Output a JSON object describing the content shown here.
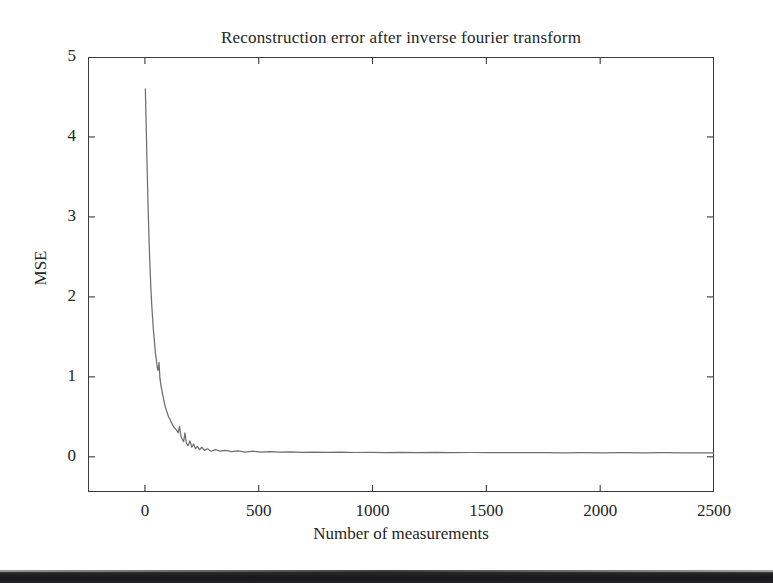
{
  "figure": {
    "background_color": "#ffffff",
    "foreground_color": "#242424",
    "line_color": "#6e6e6e"
  },
  "chart_data": {
    "type": "line",
    "title": "Reconstruction error after inverse fourier transform",
    "xlabel": "Number of measurements",
    "ylabel": "MSE",
    "xlim": [
      -250,
      2500
    ],
    "ylim": [
      -0.44,
      5
    ],
    "grid": false,
    "legend": null,
    "xticks": [
      0,
      500,
      1000,
      1500,
      2000,
      2500
    ],
    "xticklabels": [
      "0",
      "500",
      "1000",
      "1500",
      "2000",
      "2500"
    ],
    "yticks": [
      0,
      1,
      2,
      3,
      4,
      5
    ],
    "yticklabels": [
      "0",
      "1",
      "2",
      "3",
      "4",
      "5"
    ],
    "series": [
      {
        "name": "MSE",
        "color": "#6e6e6e",
        "x": [
          2,
          6,
          10,
          14,
          18,
          22,
          26,
          30,
          34,
          38,
          42,
          46,
          50,
          54,
          58,
          62,
          66,
          70,
          74,
          78,
          82,
          86,
          90,
          94,
          98,
          104,
          110,
          116,
          122,
          128,
          134,
          140,
          146,
          152,
          158,
          164,
          170,
          176,
          182,
          190,
          198,
          206,
          214,
          222,
          230,
          240,
          250,
          262,
          275,
          290,
          310,
          330,
          355,
          380,
          410,
          440,
          475,
          510,
          550,
          590,
          640,
          690,
          745,
          800,
          860,
          925,
          990,
          1060,
          1130,
          1200,
          1275,
          1350,
          1430,
          1510,
          1590,
          1670,
          1755,
          1840,
          1925,
          2010,
          2100,
          2190,
          2280,
          2370,
          2440,
          2500
        ],
        "y": [
          4.6,
          4.1,
          3.58,
          3.12,
          2.72,
          2.4,
          2.12,
          1.9,
          1.72,
          1.56,
          1.44,
          1.3,
          1.22,
          1.12,
          1.08,
          1.18,
          0.98,
          0.9,
          0.84,
          0.78,
          0.72,
          0.67,
          0.62,
          0.58,
          0.55,
          0.5,
          0.47,
          0.43,
          0.4,
          0.37,
          0.35,
          0.33,
          0.3,
          0.38,
          0.26,
          0.22,
          0.19,
          0.3,
          0.17,
          0.14,
          0.2,
          0.12,
          0.16,
          0.1,
          0.13,
          0.09,
          0.12,
          0.08,
          0.1,
          0.07,
          0.09,
          0.07,
          0.08,
          0.065,
          0.075,
          0.06,
          0.07,
          0.06,
          0.065,
          0.058,
          0.062,
          0.056,
          0.06,
          0.055,
          0.058,
          0.054,
          0.057,
          0.053,
          0.056,
          0.052,
          0.055,
          0.052,
          0.054,
          0.051,
          0.053,
          0.051,
          0.052,
          0.05,
          0.052,
          0.05,
          0.051,
          0.05,
          0.051,
          0.05,
          0.05,
          0.05
        ]
      }
    ],
    "annotations": {
      "peak_value": 4.6,
      "tail_value": 0.05
    }
  }
}
